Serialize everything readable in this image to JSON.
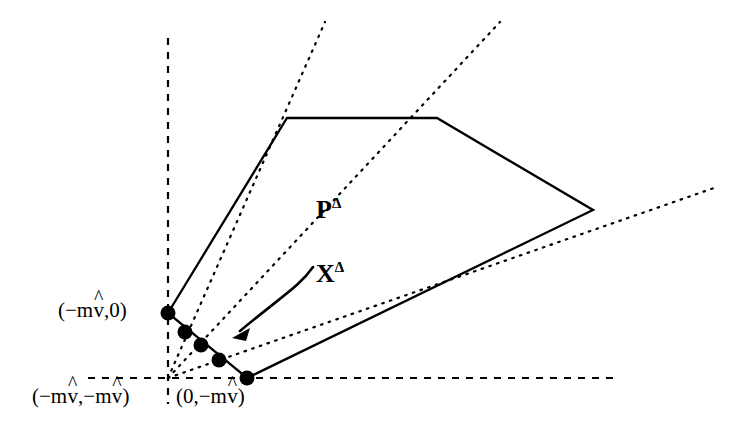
{
  "figure": {
    "type": "geometric-diagram",
    "background": "#ffffff",
    "ink_color": "#000000",
    "width": 742,
    "height": 446
  },
  "axes": {
    "style": "dashed",
    "origin": {
      "x": 168,
      "y": 378
    },
    "vertical": {
      "x": 168,
      "y_top": 38,
      "y_bottom": 404
    },
    "horizontal": {
      "y": 378,
      "x_left": 88,
      "x_right": 616
    }
  },
  "polygon": {
    "name": "P-Delta",
    "stroke": "#000000",
    "fill": "none",
    "vertices": [
      {
        "x": 168,
        "y": 313,
        "label": "(-mv,0)"
      },
      {
        "x": 287,
        "y": 118,
        "label": ""
      },
      {
        "x": 437,
        "y": 118,
        "label": ""
      },
      {
        "x": 593,
        "y": 210,
        "label": ""
      },
      {
        "x": 247,
        "y": 378,
        "label": "(0,-mv)"
      }
    ]
  },
  "lattice_points": {
    "name": "X-Delta",
    "radius": 7,
    "points": [
      {
        "x": 168,
        "y": 313
      },
      {
        "x": 185,
        "y": 332
      },
      {
        "x": 201,
        "y": 345
      },
      {
        "x": 219,
        "y": 360
      },
      {
        "x": 247,
        "y": 378
      }
    ]
  },
  "dotted_rays": {
    "style": "dotted",
    "origin": {
      "x": 168,
      "y": 378
    },
    "rays": [
      {
        "x2": 325,
        "y2": 22
      },
      {
        "x2": 500,
        "y2": 22
      },
      {
        "x2": 714,
        "y2": 188
      }
    ]
  },
  "arrow": {
    "name": "X-Delta-pointer",
    "from": {
      "x": 312,
      "y": 268
    },
    "to": {
      "x": 224,
      "y": 345
    },
    "head": "solid-triangle"
  },
  "labels": {
    "p_delta": {
      "base": "P",
      "superscript": "Δ",
      "x": 316,
      "y": 198
    },
    "x_delta": {
      "base": "X",
      "superscript": "Δ",
      "x": 316,
      "y": 262
    },
    "left_vertex": {
      "text": "(−mv̂,0)",
      "prefix": "(−m",
      "hat_var": "v",
      "suffix": ",0)",
      "x": 58,
      "y": 300
    },
    "origin_corner": {
      "text": "(−mv̂,−mv̂)",
      "prefix": "(−m",
      "hat_var": "v",
      "middle": ",−m",
      "suffix": ")",
      "x": 32,
      "y": 386
    },
    "bottom_vertex": {
      "text": "(0,−mv̂)",
      "prefix": "(0,−m",
      "hat_var": "v",
      "suffix": ")",
      "x": 176,
      "y": 386
    }
  }
}
